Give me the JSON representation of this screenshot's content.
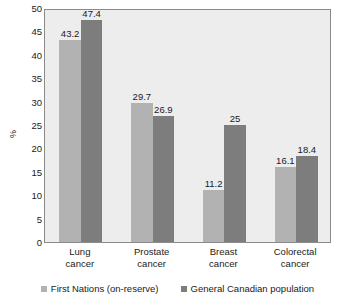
{
  "chart_data": {
    "type": "bar",
    "title": "",
    "xlabel": "",
    "ylabel": "%",
    "ylim": [
      0,
      50
    ],
    "ytick_step": 5,
    "yticks": [
      50,
      45,
      40,
      35,
      30,
      25,
      20,
      15,
      10,
      5,
      0
    ],
    "grid": false,
    "legend_position": "bottom",
    "categories": [
      {
        "line1": "Lung",
        "line2": "cancer"
      },
      {
        "line1": "Prostate",
        "line2": "cancer"
      },
      {
        "line1": "Breast",
        "line2": "cancer"
      },
      {
        "line1": "Colorectal",
        "line2": "cancer"
      }
    ],
    "series": [
      {
        "name": "First Nations (on-reserve)",
        "color": "#b2b2b2",
        "values": [
          43.2,
          29.7,
          11.2,
          16.1
        ],
        "labels": [
          "43.2",
          "29.7",
          "11.2",
          "16.1"
        ]
      },
      {
        "name": "General Canadian population",
        "color": "#7d7d7d",
        "values": [
          47.4,
          26.9,
          25,
          18.4
        ],
        "labels": [
          "47.4",
          "26.9",
          "25",
          "18.4"
        ]
      }
    ]
  },
  "plot": {
    "background_color": "#ededed",
    "border_color": "#8a8a8a"
  }
}
